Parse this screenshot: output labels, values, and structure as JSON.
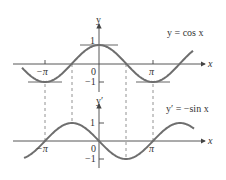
{
  "chart_data": [
    {
      "type": "line",
      "title": "y = cos x",
      "function": "cos",
      "xlabel": "x",
      "ylabel": "y",
      "xticks": [
        "-π",
        "π"
      ],
      "yticks": [
        "1",
        "0",
        "-1"
      ],
      "xlim": [
        -4.0,
        5.0
      ],
      "ylim": [
        -1.2,
        1.5
      ],
      "horizontal_tangents_at": [
        -3.1416,
        0,
        3.1416
      ],
      "x": [
        -3.9,
        -3.1416,
        -1.5708,
        0,
        1.5708,
        3.1416,
        4.7124,
        5.0
      ],
      "values": [
        -0.73,
        -1,
        0,
        1,
        0,
        -1,
        0,
        0.28
      ],
      "grid": false,
      "legend": "none"
    },
    {
      "type": "line",
      "title": "y′ = −sin x",
      "function": "-sin",
      "xlabel": "x",
      "ylabel": "y′",
      "xticks": [
        "-π",
        "π"
      ],
      "yticks": [
        "1",
        "0",
        "-1"
      ],
      "xlim": [
        -4.0,
        5.0
      ],
      "ylim": [
        -1.5,
        1.5
      ],
      "x": [
        -3.9,
        -3.1416,
        -1.5708,
        0,
        1.5708,
        3.1416,
        4.7124,
        5.0
      ],
      "values": [
        -0.69,
        0,
        1,
        0,
        -1,
        0,
        1,
        0.96
      ],
      "grid": false,
      "legend": "none"
    }
  ],
  "top": {
    "equation": "y = cos x",
    "y_axis_label": "y",
    "x_axis_label": "x",
    "tick_one": "1",
    "tick_zero": "0",
    "tick_minus_one": "−1",
    "tick_neg_pi": "−π",
    "tick_pi": "π"
  },
  "bottom": {
    "equation": "y′ = −sin x",
    "y_axis_label": "y′",
    "x_axis_label": "x",
    "tick_one": "1",
    "tick_zero": "0",
    "tick_minus_one": "−1",
    "tick_neg_pi": "−π",
    "tick_pi": "π"
  },
  "colors": {
    "curve": "#6e6e6e",
    "axis": "#444444",
    "dashed": "#777777"
  }
}
